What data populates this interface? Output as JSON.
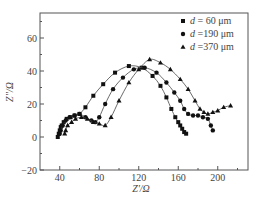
{
  "chart_data": {
    "type": "scatter",
    "title": "",
    "xlabel": "Z'/Ω",
    "ylabel": "Z''/Ω",
    "xlim": [
      20,
      225
    ],
    "ylim": [
      -20,
      75
    ],
    "xticks": [
      40,
      80,
      120,
      160,
      200
    ],
    "yticks": [
      -20,
      0,
      20,
      40,
      60
    ],
    "grid": false,
    "legend_position": "upper right",
    "series": [
      {
        "name": "d = 60 μm",
        "marker": "square",
        "x": [
          38,
          39,
          40,
          41,
          42,
          44,
          47,
          51,
          55,
          60,
          66,
          74,
          84,
          96,
          110,
          123,
          134,
          142,
          148,
          153,
          157,
          160,
          162,
          164,
          166,
          168
        ],
        "y": [
          0,
          2,
          4,
          6,
          7,
          9,
          11,
          12,
          13,
          14,
          18,
          25,
          32,
          39,
          43,
          42,
          37,
          31,
          24,
          17,
          12,
          9,
          7,
          5,
          3,
          2
        ]
      },
      {
        "name": "d = 190 μm",
        "marker": "circle",
        "x": [
          40,
          41,
          43,
          46,
          50,
          55,
          60,
          66,
          72,
          76,
          80,
          86,
          94,
          104,
          115,
          126,
          138,
          148,
          156,
          162,
          166,
          170,
          175,
          180,
          185,
          190,
          193,
          195
        ],
        "y": [
          2,
          4,
          7,
          10,
          12,
          13,
          14,
          12,
          10,
          9,
          12,
          20,
          29,
          36,
          41,
          42,
          39,
          33,
          27,
          22,
          17,
          14,
          13,
          13,
          12,
          11,
          7,
          4
        ],
        "x_note": "approximate"
      },
      {
        "name": "d = 370 μm",
        "marker": "triangle",
        "x": [
          45,
          46,
          48,
          52,
          56,
          62,
          68,
          74,
          80,
          86,
          92,
          100,
          110,
          120,
          131,
          142,
          152,
          162,
          170,
          177,
          182,
          186,
          190,
          195,
          200,
          206,
          213
        ],
        "y": [
          2,
          4,
          7,
          9,
          11,
          12,
          11,
          9,
          8,
          7,
          12,
          22,
          33,
          41,
          47,
          45,
          41,
          35,
          29,
          22,
          17,
          15,
          14,
          15,
          16,
          18,
          19
        ]
      }
    ]
  },
  "legend": {
    "items": [
      {
        "marker": "square",
        "text": "d = 60 μm"
      },
      {
        "marker": "circle",
        "text": "d =190 μm"
      },
      {
        "marker": "triangle",
        "text": "d =370 μm"
      }
    ]
  },
  "axes": {
    "xlabel": "Z'/Ω",
    "ylabel": "Z''/Ω",
    "xtick_labels": [
      "40",
      "80",
      "120",
      "160",
      "200"
    ],
    "ytick_labels": [
      "60",
      "40",
      "20",
      "0",
      "−20"
    ]
  }
}
